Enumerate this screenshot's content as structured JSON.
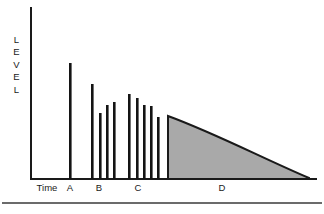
{
  "figure": {
    "background_color": "#ffffff",
    "axis_color": "#1a1a1a",
    "bar_color": "#141414",
    "shade_fill_color": "#a9a9a9",
    "footer_rule_color": "#3a3a3a"
  },
  "axes": {
    "y_label_letters": [
      "L",
      "E",
      "V",
      "E",
      "L"
    ],
    "y_label_text": "LEVEL",
    "x_axis_name": "Time",
    "x_origin_px": 31,
    "x_end_px": 316,
    "y_top_px": 8,
    "y_baseline_px": 179
  },
  "x_labels": [
    {
      "text": "Time",
      "x_px": 47
    },
    {
      "text": "A",
      "x_px": 70
    },
    {
      "text": "B",
      "x_px": 99
    },
    {
      "text": "C",
      "x_px": 138
    },
    {
      "text": "D",
      "x_px": 222
    }
  ],
  "chart_data": {
    "type": "bar",
    "title": "",
    "xlabel": "Time",
    "ylabel": "LEVEL",
    "grid": false,
    "legend": false,
    "xlim": [
      0,
      100
    ],
    "ylim": [
      0,
      100
    ],
    "categories": [
      "A",
      "B",
      "C",
      "D"
    ],
    "groups": [
      {
        "label": "A",
        "kind": "bars",
        "values": [
          68
        ],
        "bars": [
          {
            "x_px": 69,
            "width_px": 2.6,
            "top_px": 63,
            "height_px": 116
          }
        ]
      },
      {
        "label": "B",
        "kind": "bars",
        "values": [
          56,
          42,
          47,
          49
        ],
        "bars": [
          {
            "x_px": 91,
            "width_px": 2.6,
            "top_px": 84,
            "height_px": 95
          },
          {
            "x_px": 99,
            "width_px": 2.6,
            "top_px": 113,
            "height_px": 66
          },
          {
            "x_px": 106,
            "width_px": 2.6,
            "top_px": 105,
            "height_px": 74
          },
          {
            "x_px": 113,
            "width_px": 2.6,
            "top_px": 102,
            "height_px": 77
          }
        ]
      },
      {
        "label": "C",
        "kind": "bars",
        "values": [
          52,
          49,
          45,
          44,
          37
        ],
        "bars": [
          {
            "x_px": 128,
            "width_px": 2.6,
            "top_px": 94,
            "height_px": 85
          },
          {
            "x_px": 136,
            "width_px": 2.6,
            "top_px": 98,
            "height_px": 81
          },
          {
            "x_px": 143,
            "width_px": 2.6,
            "top_px": 105,
            "height_px": 74
          },
          {
            "x_px": 150,
            "width_px": 2.6,
            "top_px": 106,
            "height_px": 73
          },
          {
            "x_px": 157,
            "width_px": 2.6,
            "top_px": 117,
            "height_px": 62
          }
        ]
      },
      {
        "label": "D",
        "kind": "shaded-decay",
        "start_level": 37,
        "end_level": 0,
        "start_x_px": 168,
        "end_x_px": 309,
        "top_px": 116,
        "baseline_px": 179,
        "shape": "concave-decay"
      }
    ]
  },
  "footer": {
    "rule_y_px": 203
  }
}
